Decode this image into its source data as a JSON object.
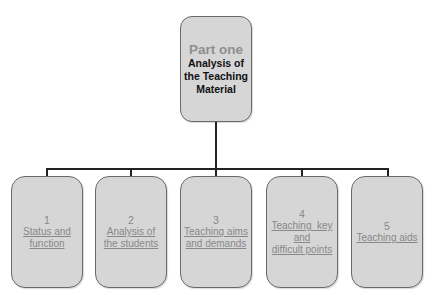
{
  "root": {
    "part": "Part one",
    "title_lines": [
      "Analysis of",
      "the Teaching",
      "Material"
    ]
  },
  "children": [
    {
      "num": "1",
      "lines": [
        "Status and",
        "function"
      ]
    },
    {
      "num": "2",
      "lines": [
        "Analysis of",
        "the students"
      ]
    },
    {
      "num": "3",
      "lines": [
        "Teaching aims",
        "and demands"
      ]
    },
    {
      "num": "4",
      "lines": [
        "Teaching  key",
        "and",
        "difficult points"
      ]
    },
    {
      "num": "5",
      "lines": [
        "Teaching aids"
      ]
    }
  ],
  "colors": {
    "box_fill": "#d6d6d6",
    "box_border": "#6a6a6a",
    "root_part_text": "#8f8f8f",
    "child_text": "#888888",
    "connector": "#222222"
  }
}
